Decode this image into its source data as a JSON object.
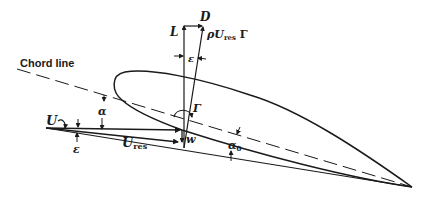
{
  "figure": {
    "type": "airfoil-lifting-line-diagram",
    "background": "#ffffff",
    "ink_color": "#1a1a1a"
  },
  "labels": {
    "chord_line": "Chord line",
    "lift": "L",
    "drag": "D",
    "rho_u_res_gamma": "ρU",
    "rho_u_res_gamma_sub": "res",
    "rho_u_res_gamma_tail": " Γ",
    "epsilon_top": "ε",
    "epsilon_left": "ε",
    "alpha": "α",
    "alpha_zero": "α",
    "alpha_zero_sub": "0",
    "gamma": "Γ",
    "freestream": "U",
    "resultant_velocity": "U",
    "resultant_velocity_sub": "res",
    "downwash": "w"
  }
}
